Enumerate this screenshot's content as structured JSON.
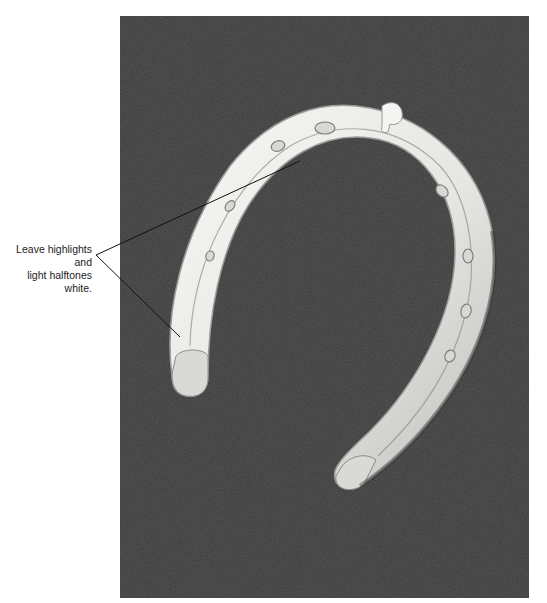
{
  "figure": {
    "background_color": "#3b3b3b",
    "highlight_color": "#f2f2f0"
  },
  "annotation": {
    "line1": "Leave highlights and",
    "line2": "light halftones white.",
    "leader_color": "#111111"
  }
}
